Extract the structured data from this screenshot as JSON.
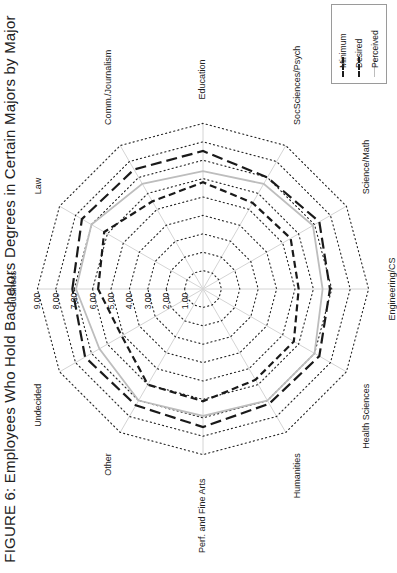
{
  "title": "FIGURE 6: Employees Who Hold Bachelors Degrees in Certain Majors by Major",
  "legend": {
    "items": [
      {
        "label": "Minimum",
        "style": "dashed-short",
        "color": "#1a1a1a"
      },
      {
        "label": "Desired",
        "style": "dashed-long",
        "color": "#1a1a1a"
      },
      {
        "label": "Perceived",
        "style": "solid",
        "color": "#bdbdbd"
      }
    ]
  },
  "chart_data": {
    "type": "radar",
    "title": "FIGURE 6: Employees Who Hold Bachelors Degrees in Certain Majors by Major",
    "orientation": "rotated 90° counter-clockwise",
    "categories": [
      "Business",
      "Law",
      "Comm./Journalism",
      "Education",
      "SocSciences/Psych",
      "Science/Math",
      "Engineering/CS",
      "Health Sciences",
      "Humanities",
      "Perf. and Fine Arts",
      "Other",
      "Undecided"
    ],
    "tick_labels": [
      "1.00",
      "2.00",
      "3.00",
      "4.00",
      "5.00",
      "6.00",
      "7.00",
      "8.00",
      "9.00"
    ],
    "rlim": [
      0,
      9
    ],
    "grid": true,
    "legend_position": "top-right",
    "series": [
      {
        "name": "Minimum",
        "values": [
          5.7,
          6.2,
          5.5,
          5.8,
          5.4,
          5.5,
          5.2,
          5.7,
          5.7,
          6.1,
          6.0,
          5.1
        ]
      },
      {
        "name": "Desired",
        "values": [
          7.1,
          7.6,
          7.5,
          7.5,
          7.0,
          7.3,
          6.9,
          7.3,
          7.2,
          7.5,
          7.3,
          7.4
        ]
      },
      {
        "name": "Perceived",
        "values": [
          6.9,
          7.0,
          6.6,
          6.4,
          6.6,
          6.9,
          6.5,
          7.0,
          7.0,
          6.9,
          7.0,
          6.5
        ]
      }
    ]
  }
}
